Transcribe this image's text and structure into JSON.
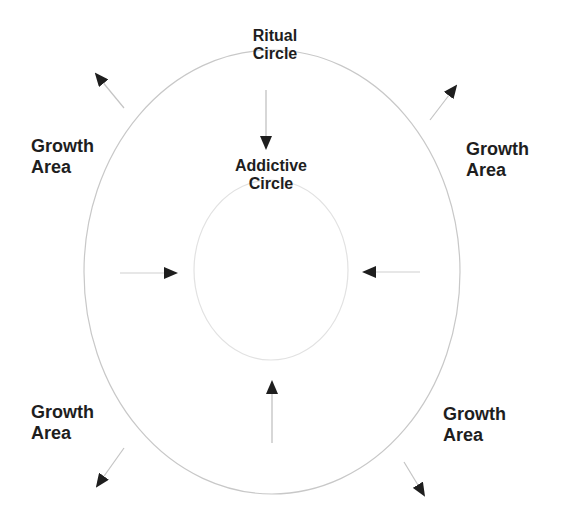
{
  "diagram": {
    "type": "concentric-circles",
    "labels": {
      "ritual_circle": {
        "line1": "Ritual",
        "line2": "Circle"
      },
      "addictive_circle": {
        "line1": "Addictive",
        "line2": "Circle"
      },
      "growth_top_left": {
        "line1": "Growth",
        "line2": "Area"
      },
      "growth_top_right": {
        "line1": "Growth",
        "line2": "Area"
      },
      "growth_bottom_left": {
        "line1": "Growth",
        "line2": "Area"
      },
      "growth_bottom_right": {
        "line1": "Growth",
        "line2": "Area"
      }
    },
    "shapes": {
      "outer_circle": {
        "name": "Ritual Circle",
        "cx": 272,
        "cy": 272,
        "rx": 188,
        "ry": 222
      },
      "inner_circle": {
        "name": "Addictive Circle",
        "cx": 271,
        "cy": 270,
        "rx": 77,
        "ry": 90
      }
    },
    "arrows": [
      {
        "name": "top-inward",
        "direction": "inward",
        "from": [
          266,
          90
        ],
        "to": [
          266,
          148
        ]
      },
      {
        "name": "left-inward",
        "direction": "inward",
        "from": [
          120,
          273
        ],
        "to": [
          176,
          273
        ]
      },
      {
        "name": "right-inward",
        "direction": "inward",
        "from": [
          420,
          272
        ],
        "to": [
          364,
          272
        ]
      },
      {
        "name": "bottom-inward",
        "direction": "inward",
        "from": [
          272,
          443
        ],
        "to": [
          272,
          382
        ]
      },
      {
        "name": "top-left-outward",
        "direction": "outward",
        "from": [
          124,
          108
        ],
        "to": [
          96,
          74
        ]
      },
      {
        "name": "top-right-outward",
        "direction": "outward",
        "from": [
          430,
          120
        ],
        "to": [
          456,
          86
        ]
      },
      {
        "name": "bottom-left-outward",
        "direction": "outward",
        "from": [
          124,
          448
        ],
        "to": [
          96,
          486
        ]
      },
      {
        "name": "bottom-right-outward",
        "direction": "outward",
        "from": [
          404,
          462
        ],
        "to": [
          424,
          494
        ]
      }
    ],
    "colors": {
      "background": "#ffffff",
      "outline": "#c8c8c8",
      "inner_outline": "#e2e2e2",
      "arrow_shaft": "#bdbdbd",
      "arrow_head": "#1e1e1e",
      "text": "#1e1e1e"
    }
  }
}
